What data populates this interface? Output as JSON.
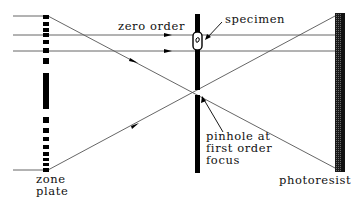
{
  "diagram": {
    "type": "optical schematic",
    "labels": {
      "zero_order": "zero order",
      "specimen": "specimen",
      "pinhole_line1": "pinhole at",
      "pinhole_line2": "first order",
      "pinhole_line3": "focus",
      "zone_plate_line1": "zone",
      "zone_plate_line2": "plate",
      "photoresist": "photoresist"
    },
    "components": [
      "zone plate",
      "pinhole at first order focus",
      "specimen",
      "photoresist"
    ],
    "colors": {
      "lines": "#555555",
      "components": "#000000",
      "photoresist_fill": "#333333",
      "background": "#ffffff"
    }
  }
}
